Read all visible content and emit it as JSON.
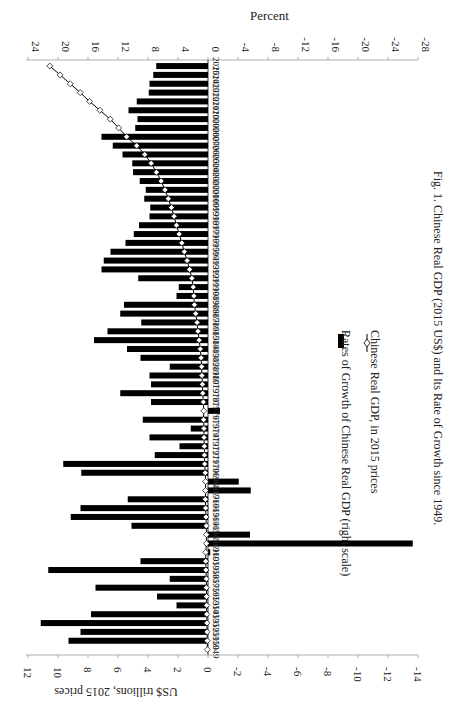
{
  "chart_data": {
    "type": "bar",
    "orientation": "rotated 90 degrees clockwise (years run bottom-to-top, values increase leftwards)",
    "caption": "Fig. 1. Chinese Real GDP (2015 US$) and Its Rate of Growth since 1949.",
    "left_axis": {
      "label": "US$ trillions, 2015  prices",
      "ticks": [
        "12",
        "10",
        "8",
        "6",
        "4",
        "2",
        "0",
        "-2",
        "-4",
        "-6",
        "-8",
        "-10",
        "-12",
        "-14"
      ],
      "range": [
        -14,
        12
      ]
    },
    "right_axis": {
      "label": "Percent",
      "ticks": [
        "24",
        "20",
        "16",
        "12",
        "8",
        "4",
        "0",
        "-4",
        "-8",
        "-12",
        "-16",
        "-20",
        "-24",
        "-28"
      ],
      "range": [
        -28,
        24
      ]
    },
    "legend": {
      "placement": "center-right",
      "entries": [
        {
          "label": "Rates of Growth of Chinese Real GDP (right scale)",
          "marker": "bar"
        },
        {
          "label": "Chinese Real GDP, in 2015 prices",
          "marker": "line-diamond"
        }
      ]
    },
    "categories": [
      "1949",
      "1950",
      "1951",
      "1952",
      "1953",
      "1954",
      "1955",
      "1956",
      "1957",
      "1958",
      "1959",
      "1960",
      "1961",
      "1962",
      "1963",
      "1964",
      "1965",
      "1966",
      "1967",
      "1968",
      "1969",
      "1970",
      "1971",
      "1972",
      "1973",
      "1974",
      "1975",
      "1976",
      "1977",
      "1978",
      "1979",
      "1980",
      "1981",
      "1982",
      "1983",
      "1984",
      "1985",
      "1986",
      "1987",
      "1988",
      "1989",
      "1990",
      "1991",
      "1992",
      "1993",
      "1994",
      "1995",
      "1996",
      "1997",
      "1998",
      "1999",
      "2000",
      "2001",
      "2002",
      "2003",
      "2004",
      "2005",
      "2006",
      "2007",
      "2008",
      "2009",
      "2010",
      "2011",
      "2012",
      "2013",
      "2014",
      "2015"
    ],
    "series": [
      {
        "name": "Rates of Growth of Chinese Real GDP (right scale)",
        "type": "bar",
        "axis": "right",
        "values": [
          null,
          18.6,
          17.0,
          22.3,
          15.6,
          4.2,
          6.8,
          15.0,
          5.1,
          21.3,
          9.0,
          -0.3,
          -27.3,
          -5.6,
          10.2,
          18.3,
          17.0,
          10.7,
          -5.7,
          -4.1,
          16.9,
          19.3,
          7.1,
          3.8,
          7.8,
          2.3,
          8.7,
          -1.6,
          7.6,
          11.7,
          7.6,
          7.8,
          5.1,
          9.0,
          10.8,
          15.2,
          13.4,
          8.9,
          11.7,
          11.2,
          4.2,
          3.9,
          9.3,
          14.2,
          13.9,
          13.0,
          11.0,
          9.9,
          9.2,
          7.8,
          7.7,
          8.5,
          8.3,
          9.1,
          10.0,
          10.1,
          11.4,
          12.7,
          14.2,
          9.7,
          9.4,
          10.6,
          9.5,
          7.9,
          7.8,
          7.3,
          6.9
        ]
      },
      {
        "name": "Chinese Real GDP, in 2015 prices",
        "type": "line",
        "axis": "left",
        "values": [
          0.08,
          0.09,
          0.11,
          0.13,
          0.15,
          0.16,
          0.17,
          0.19,
          0.2,
          0.25,
          0.27,
          0.27,
          0.19,
          0.18,
          0.2,
          0.24,
          0.28,
          0.31,
          0.29,
          0.28,
          0.33,
          0.39,
          0.42,
          0.43,
          0.47,
          0.48,
          0.52,
          0.51,
          0.55,
          0.62,
          0.66,
          0.72,
          0.75,
          0.82,
          0.91,
          1.05,
          1.19,
          1.3,
          1.45,
          1.61,
          1.68,
          1.75,
          1.91,
          2.18,
          2.48,
          2.81,
          3.11,
          3.42,
          3.74,
          4.03,
          4.34,
          4.71,
          5.1,
          5.56,
          6.12,
          6.74,
          7.5,
          8.46,
          9.66,
          10.6,
          11.6,
          12.83,
          14.05,
          15.16,
          16.35,
          17.55,
          18.77
        ]
      }
    ]
  }
}
